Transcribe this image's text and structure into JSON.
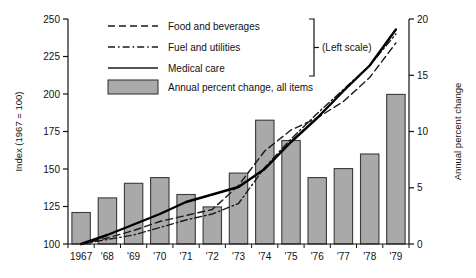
{
  "chart_data": {
    "type": "bar",
    "title": "",
    "subtitle": "",
    "categories": [
      "1967",
      "'68",
      "'69",
      "'70",
      "'71",
      "'72",
      "'73",
      "'74",
      "'75",
      "'76",
      "'77",
      "'78",
      "'79"
    ],
    "xlabel": "",
    "ylabel": "Index (1967 = 100)",
    "ylabel_right": "Annual percent change",
    "ylim": [
      100,
      250
    ],
    "yticks": [
      100,
      125,
      150,
      175,
      200,
      225,
      250
    ],
    "ylim_right": [
      0,
      20
    ],
    "yticks_right": [
      0,
      5,
      10,
      15,
      20
    ],
    "grid": false,
    "legend_position": "top-left",
    "bars": {
      "name": "Annual percent change, all items",
      "axis": "right",
      "color": "#a9a9a9",
      "edge_color": "#3a3a3a",
      "values": [
        2.8,
        4.1,
        5.4,
        5.9,
        4.4,
        3.3,
        6.3,
        11.0,
        9.2,
        5.9,
        6.7,
        8.0,
        13.3
      ]
    },
    "series": [
      {
        "name": "Food and beverages",
        "axis": "left",
        "style": "dashed",
        "color": "#1a1a1a",
        "values": [
          100,
          104,
          109,
          115,
          119,
          123,
          139,
          162,
          176,
          184,
          195,
          211,
          234
        ]
      },
      {
        "name": "Fuel and utilities",
        "axis": "left",
        "style": "dash-dot",
        "color": "#1a1a1a",
        "values": [
          100,
          103,
          106,
          111,
          116,
          120,
          127,
          151,
          170,
          187,
          203,
          219,
          240
        ]
      },
      {
        "name": "Medical care",
        "axis": "left",
        "style": "solid",
        "color": "#000000",
        "values": [
          100,
          106,
          113,
          120,
          128,
          133,
          138,
          150,
          168,
          184,
          202,
          219,
          243
        ]
      }
    ],
    "annotations": [
      {
        "text": "(Left scale)",
        "target": "line-series-bracket"
      }
    ]
  },
  "legend": {
    "entries": [
      {
        "label": "Food and beverages",
        "swatch": "dashed-line-swatch"
      },
      {
        "label": "Fuel and utilities",
        "swatch": "dash-dot-line-swatch"
      },
      {
        "label": "Medical care",
        "swatch": "solid-line-swatch"
      },
      {
        "label": "Annual percent change, all items",
        "swatch": "gray-box-swatch"
      }
    ],
    "bracket_note": "(Left scale)"
  },
  "axes": {
    "left_title": "Index (1967 = 100)",
    "right_title": "Annual percent change",
    "left_ticks": [
      "250",
      "225",
      "200",
      "175",
      "150",
      "125",
      "100"
    ],
    "right_ticks": [
      "20",
      "15",
      "10",
      "5",
      "0"
    ],
    "x_ticks": [
      "1967",
      "'68",
      "'69",
      "'70",
      "'71",
      "'72",
      "'73",
      "'74",
      "'75",
      "'76",
      "'77",
      "'78",
      "'79"
    ]
  }
}
